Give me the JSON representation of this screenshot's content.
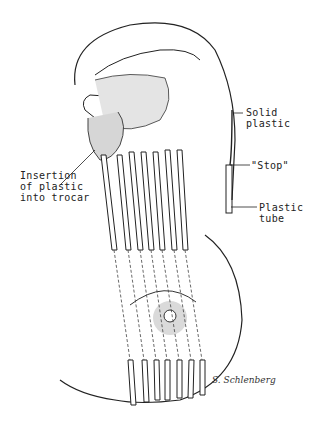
{
  "figure": {
    "type": "medical-illustration",
    "labels": {
      "solid_plastic": "Solid\nplastic",
      "stop": "\"Stop\"",
      "plastic_tube": "Plastic\ntube",
      "insertion": "Insertion\nof plastic\ninto trocar"
    },
    "signature": "S. Schlenberg",
    "trocar_count": 7
  }
}
